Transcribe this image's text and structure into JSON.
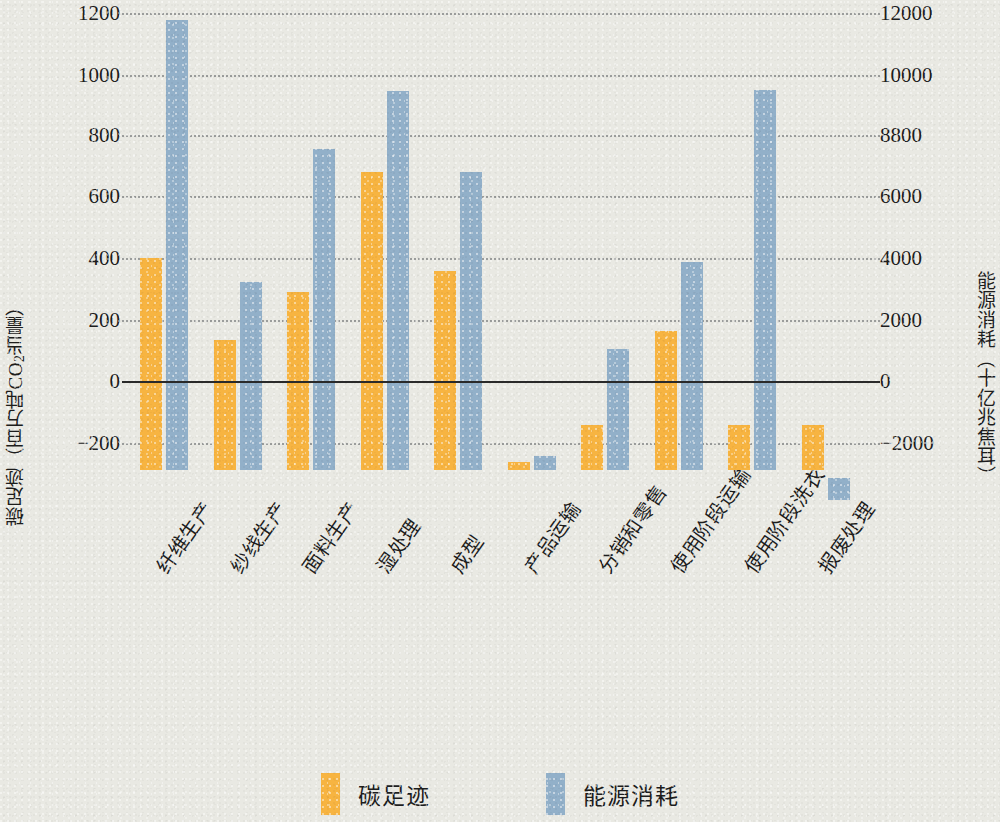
{
  "chart_data": {
    "type": "bar",
    "title": "",
    "categories": [
      "纤维生产",
      "纱线生产",
      "面料生产",
      "湿处理",
      "成型",
      "产品运输",
      "分销和零售",
      "使用阶段运输",
      "使用阶段洗衣",
      "报废处理"
    ],
    "series": [
      {
        "name": "碳足迹",
        "color": "#f7b441",
        "axis": "left",
        "values": [
          400,
          135,
          290,
          690,
          360,
          -265,
          -150,
          165,
          -150,
          -150
        ]
      },
      {
        "name": "能源消耗",
        "color": "#92b0c9",
        "axis": "right",
        "values": [
          11800,
          3350,
          7600,
          9500,
          6900,
          -2450,
          1100,
          3900,
          9500,
          -2950
        ]
      }
    ],
    "xlabel": "",
    "ylabel_left": "碳足迹（百万吨CO2当量）",
    "ylabel_right": "能源消耗（十亿兆焦耳）",
    "ylim_left": [
      -300,
      1250
    ],
    "ylim_right": [
      -3000,
      12500
    ],
    "yticks_left": [
      1200,
      1000,
      800,
      600,
      400,
      200,
      0,
      -200
    ],
    "yticks_right": [
      12000,
      10000,
      8800,
      6000,
      4000,
      2000,
      0,
      -2000
    ],
    "grid": true,
    "legend_position": "bottom"
  },
  "axes": {
    "left": {
      "title_main": "碳足迹（百万吨CO",
      "title_sub": "2",
      "title_tail": "当量）",
      "ticks": [
        {
          "label": "1200",
          "top": 13
        },
        {
          "label": "1000",
          "top": 75
        },
        {
          "label": "800",
          "top": 135
        },
        {
          "label": "600",
          "top": 196
        },
        {
          "label": "400",
          "top": 258
        },
        {
          "label": "200",
          "top": 320
        },
        {
          "label": "0",
          "top": 381
        },
        {
          "label": "−200",
          "top": 443
        }
      ]
    },
    "right": {
      "title": "能源消耗（十亿兆焦耳）",
      "ticks": [
        {
          "label": "12000",
          "top": 13
        },
        {
          "label": "10000",
          "top": 75
        },
        {
          "label": "8800",
          "top": 135
        },
        {
          "label": "6000",
          "top": 196
        },
        {
          "label": "4000",
          "top": 258
        },
        {
          "label": "2000",
          "top": 320
        },
        {
          "label": "0",
          "top": 381
        },
        {
          "label": "−2000",
          "top": 443
        }
      ]
    }
  },
  "legend": {
    "items": [
      {
        "label": "碳足迹",
        "color": "#f7b441"
      },
      {
        "label": "能源消耗",
        "color": "#92b0c9"
      }
    ]
  },
  "geometry": {
    "gridline_tops": [
      13,
      75,
      135,
      196,
      258,
      320,
      381,
      443
    ],
    "zero_top": 381,
    "plot_bottom": 470,
    "bar_tops_carbon": [
      258,
      340,
      292,
      172,
      271,
      462,
      425,
      331,
      425,
      425
    ],
    "bar_tops_energy": [
      20,
      282,
      149,
      91,
      172,
      456,
      349,
      262,
      90,
      478
    ],
    "bar_bottoms_energy": [
      470,
      470,
      470,
      470,
      470,
      470,
      470,
      470,
      470,
      500
    ],
    "group_step": 73.5,
    "group_offset": 18,
    "bar_width": 22,
    "bar_gap": 4,
    "xlabel_lefts": [
      26,
      100,
      172,
      246,
      320,
      394,
      468,
      540,
      614,
      688
    ]
  }
}
